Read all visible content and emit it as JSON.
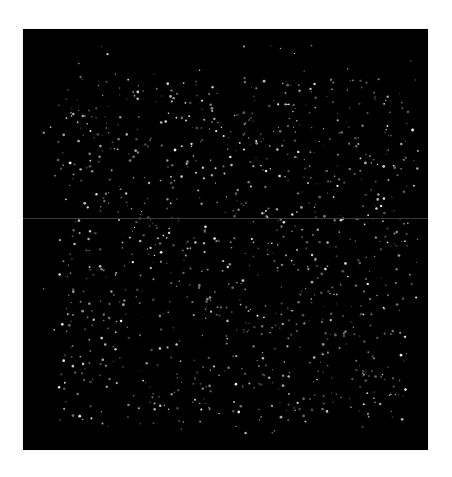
{
  "image": {
    "description": "Dark field micrograph with scattered bright point spots",
    "background_color": "#000000",
    "page_background": "#ffffff",
    "frame": {
      "x": 23,
      "y": 29,
      "width": 405,
      "height": 421
    },
    "seam_line": {
      "y_offset": 189,
      "color": "#3a3a3a"
    },
    "spots": {
      "count": 1100,
      "seed": 7331,
      "region": {
        "x0": 20,
        "y0": 15,
        "x1": 395,
        "y1": 405
      },
      "dense_region": {
        "x0": 35,
        "y0": 50,
        "x1": 385,
        "y1": 395
      },
      "color": "#ffffff",
      "min_radius": 0.5,
      "max_radius": 1.4,
      "min_alpha": 0.25,
      "max_alpha": 0.95
    }
  }
}
